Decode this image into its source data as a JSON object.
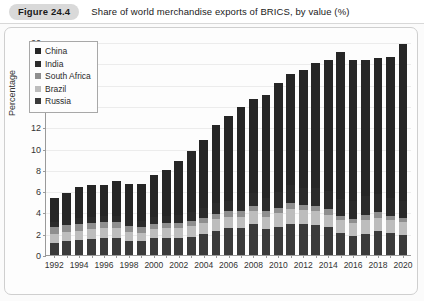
{
  "caption": {
    "figure_label": "Figure 24.4",
    "title": "Share of world merchandise exports of BRICS, by value (%)"
  },
  "chart_data": {
    "type": "bar",
    "subtype": "stacked-bar",
    "title": "Share of world merchandise exports of BRICS, by value (%)",
    "xlabel": "",
    "ylabel": "Percentage",
    "ylim": [
      0,
      20
    ],
    "yticks": [
      0,
      2,
      4,
      6,
      8,
      10,
      12,
      14,
      16,
      18,
      20
    ],
    "grid": true,
    "legend_position": "top-left",
    "categories": [
      "1992",
      "1993",
      "1994",
      "1995",
      "1996",
      "1997",
      "1998",
      "1999",
      "2000",
      "2001",
      "2002",
      "2003",
      "2004",
      "2005",
      "2006",
      "2007",
      "2008",
      "2009",
      "2010",
      "2011",
      "2012",
      "2013",
      "2014",
      "2015",
      "2016",
      "2017",
      "2018",
      "2019",
      "2020"
    ],
    "xtick_labels": [
      "1992",
      "1994",
      "1996",
      "1998",
      "2000",
      "2002",
      "2004",
      "2006",
      "2008",
      "2010",
      "2012",
      "2014",
      "2016",
      "2018",
      "2020"
    ],
    "series": [
      {
        "name": "Russia",
        "color": "#3a3a3a",
        "values": [
          1.1,
          1.3,
          1.4,
          1.5,
          1.6,
          1.6,
          1.3,
          1.3,
          1.6,
          1.6,
          1.6,
          1.7,
          2.0,
          2.3,
          2.5,
          2.5,
          2.9,
          2.4,
          2.6,
          2.9,
          2.9,
          2.8,
          2.6,
          2.1,
          1.8,
          2.0,
          2.3,
          2.1,
          1.9
        ]
      },
      {
        "name": "Brazil",
        "color": "#bdbdbd",
        "values": [
          0.9,
          0.9,
          0.9,
          0.9,
          0.9,
          0.9,
          0.9,
          0.8,
          0.8,
          0.9,
          0.9,
          1.0,
          1.0,
          1.1,
          1.1,
          1.1,
          1.2,
          1.2,
          1.3,
          1.4,
          1.3,
          1.3,
          1.2,
          1.2,
          1.2,
          1.3,
          1.2,
          1.2,
          1.2
        ]
      },
      {
        "name": "South Africa",
        "color": "#8f8f8f",
        "values": [
          0.6,
          0.6,
          0.6,
          0.6,
          0.6,
          0.6,
          0.5,
          0.5,
          0.5,
          0.5,
          0.5,
          0.5,
          0.5,
          0.5,
          0.5,
          0.5,
          0.5,
          0.5,
          0.5,
          0.6,
          0.5,
          0.5,
          0.5,
          0.4,
          0.4,
          0.5,
          0.5,
          0.4,
          0.4
        ]
      },
      {
        "name": "India",
        "color": "#2b2b2b",
        "values": [
          0.5,
          0.5,
          0.6,
          0.6,
          0.6,
          0.6,
          0.6,
          0.6,
          0.7,
          0.7,
          0.8,
          0.8,
          0.9,
          1.0,
          1.0,
          1.1,
          1.2,
          1.3,
          1.5,
          1.7,
          1.6,
          1.7,
          1.7,
          1.6,
          1.7,
          1.7,
          1.7,
          1.7,
          1.6
        ]
      },
      {
        "name": "China",
        "color": "#262626",
        "values": [
          2.3,
          2.5,
          2.9,
          3.0,
          2.9,
          3.3,
          3.4,
          3.5,
          3.9,
          4.3,
          5.0,
          5.8,
          6.4,
          7.3,
          8.0,
          8.7,
          8.9,
          9.6,
          10.3,
          10.4,
          11.1,
          11.7,
          12.3,
          13.8,
          13.2,
          12.8,
          12.8,
          13.2,
          14.7
        ]
      }
    ]
  },
  "legend": {
    "items": [
      {
        "label": "China",
        "color": "#262626"
      },
      {
        "label": "India",
        "color": "#2b2b2b"
      },
      {
        "label": "South Africa",
        "color": "#8f8f8f"
      },
      {
        "label": "Brazil",
        "color": "#bdbdbd"
      },
      {
        "label": "Russia",
        "color": "#3a3a3a"
      }
    ]
  }
}
